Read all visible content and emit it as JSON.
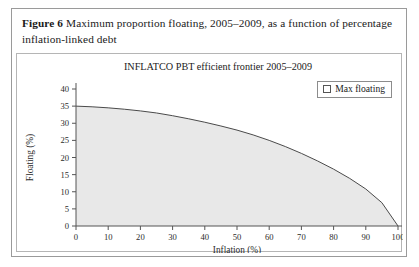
{
  "figure": {
    "caption_label": "Figure 6",
    "caption_text": "Maximum proportion floating, 2005–2009, as a function of percentage inflation-linked debt"
  },
  "legend": {
    "entries": [
      {
        "label": "Max floating",
        "marker": "hollow-square",
        "color": "#e8e8e8"
      }
    ]
  },
  "colors": {
    "area_fill": "#e8e8e8",
    "curve_line": "#4a4a4a",
    "axis": "#555555",
    "frame_border": "#9a9a9a",
    "chart_border": "#b5b5b5",
    "text": "#1a1a1a"
  },
  "chart_data": {
    "type": "area",
    "title": "INFLATCO PBT efficient frontier 2005–2009",
    "xlabel": "Inflation (%)",
    "ylabel": "Floating (%)",
    "xlim": [
      0,
      100
    ],
    "ylim": [
      0,
      40
    ],
    "xticks": [
      0,
      10,
      20,
      30,
      40,
      50,
      60,
      70,
      80,
      90,
      100
    ],
    "yticks": [
      0,
      5,
      10,
      15,
      20,
      25,
      30,
      35,
      40
    ],
    "grid": false,
    "legend_position": "top-right",
    "series": [
      {
        "name": "Max floating",
        "x": [
          0,
          5,
          10,
          15,
          20,
          25,
          30,
          35,
          40,
          45,
          50,
          55,
          60,
          65,
          70,
          75,
          80,
          85,
          90,
          95,
          100
        ],
        "values": [
          35.0,
          34.8,
          34.5,
          34.1,
          33.6,
          33.0,
          32.2,
          31.3,
          30.3,
          29.2,
          28.0,
          26.6,
          25.0,
          23.2,
          21.2,
          19.0,
          16.6,
          13.9,
          10.8,
          6.8,
          0.0
        ]
      }
    ]
  }
}
